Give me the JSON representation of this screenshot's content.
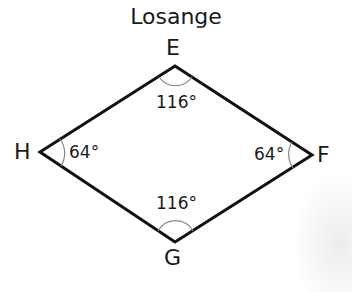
{
  "title": "Losange",
  "vertices": {
    "E": {
      "label": "E",
      "angle": "116°"
    },
    "F": {
      "label": "F",
      "angle": "64°"
    },
    "G": {
      "label": "G",
      "angle": "116°"
    },
    "H": {
      "label": "H",
      "angle": "64°"
    }
  },
  "colors": {
    "stroke": "#111111",
    "arc": "#888888",
    "text": "#1a1a1a"
  }
}
